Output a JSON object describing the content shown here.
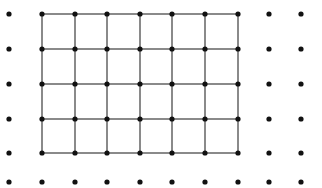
{
  "figure": {
    "background_color": "#ffffff",
    "width": 322,
    "height": 188
  },
  "lattice": {
    "name": "dot-lattice",
    "dot_color": "#111111",
    "dot_radius": 2.6,
    "columns": 10,
    "rows": 6,
    "column_x": [
      9,
      42,
      75,
      107,
      140,
      172,
      205,
      238,
      269,
      301
    ],
    "row_y": [
      14,
      49,
      84,
      119,
      153,
      182
    ],
    "total_dots": 60
  },
  "grid": {
    "name": "connected-subgrid",
    "line_color": "#8a8a8a",
    "line_width": 1.1,
    "columns": 7,
    "rows": 5,
    "column_x": [
      42,
      75,
      107,
      140,
      172,
      205,
      238
    ],
    "row_y": [
      14,
      49,
      84,
      119,
      153
    ],
    "cells": 24,
    "bounds": {
      "left": 42,
      "top": 14,
      "right": 238,
      "bottom": 153
    }
  }
}
